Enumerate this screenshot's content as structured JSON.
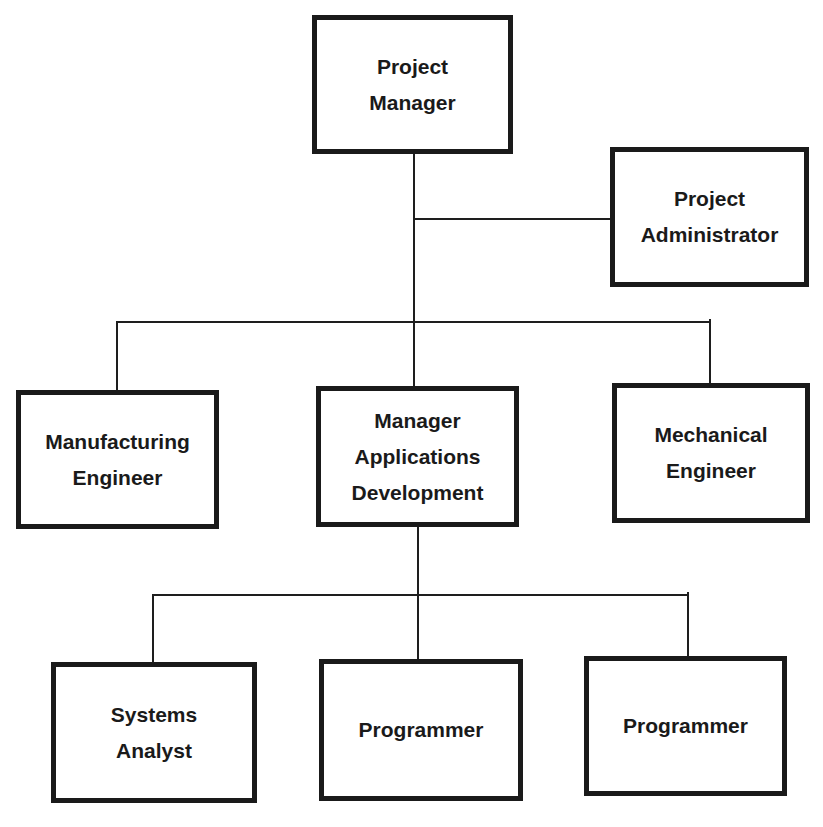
{
  "diagram": {
    "type": "org-chart",
    "nodes": {
      "project_manager": {
        "lines": [
          "Project",
          "Manager"
        ]
      },
      "project_administrator": {
        "lines": [
          "Project",
          "Administrator"
        ]
      },
      "manufacturing_engineer": {
        "lines": [
          "Manufacturing",
          "Engineer"
        ]
      },
      "manager_applications_development": {
        "lines": [
          "Manager",
          "Applications",
          "Development"
        ]
      },
      "mechanical_engineer": {
        "lines": [
          "Mechanical",
          "Engineer"
        ]
      },
      "systems_analyst": {
        "lines": [
          "Systems",
          "Analyst"
        ]
      },
      "programmer_1": {
        "lines": [
          "Programmer"
        ]
      },
      "programmer_2": {
        "lines": [
          "Programmer"
        ]
      }
    },
    "edges": [
      {
        "from": "project_manager",
        "to": "project_administrator",
        "kind": "staff"
      },
      {
        "from": "project_manager",
        "to": "manufacturing_engineer"
      },
      {
        "from": "project_manager",
        "to": "manager_applications_development"
      },
      {
        "from": "project_manager",
        "to": "mechanical_engineer"
      },
      {
        "from": "manager_applications_development",
        "to": "systems_analyst"
      },
      {
        "from": "manager_applications_development",
        "to": "programmer_1"
      },
      {
        "from": "manager_applications_development",
        "to": "programmer_2"
      }
    ]
  }
}
